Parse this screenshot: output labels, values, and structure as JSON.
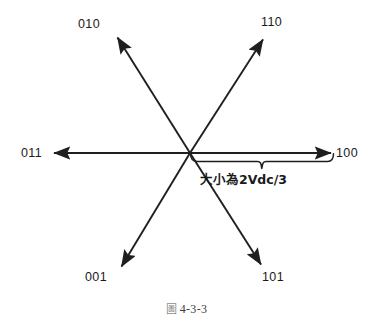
{
  "figure": {
    "caption_prefix": "圖",
    "caption_number": "4-3-3",
    "center": {
      "x": 190,
      "y": 153
    },
    "stroke_color": "#1f1f1f",
    "background_color": "#ffffff",
    "vectors": [
      {
        "id": "v010",
        "label": "010",
        "angle_deg": 120,
        "tip": {
          "x": 116,
          "y": 36
        },
        "label_pos": {
          "x": 90,
          "y": 20
        }
      },
      {
        "id": "v110",
        "label": "110",
        "angle_deg": 60,
        "tip": {
          "x": 264,
          "y": 38
        },
        "label_pos": {
          "x": 265,
          "y": 18
        }
      },
      {
        "id": "v100",
        "label": "100",
        "angle_deg": 0,
        "tip": {
          "x": 333,
          "y": 153
        },
        "label_pos": {
          "x": 337,
          "y": 147
        }
      },
      {
        "id": "v101",
        "label": "101",
        "angle_deg": -60,
        "tip": {
          "x": 262,
          "y": 266
        },
        "label_pos": {
          "x": 263,
          "y": 272
        }
      },
      {
        "id": "v001",
        "label": "001",
        "angle_deg": -120,
        "tip": {
          "x": 120,
          "y": 268
        },
        "label_pos": {
          "x": 88,
          "y": 272
        }
      },
      {
        "id": "v011",
        "label": "011",
        "angle_deg": 180,
        "tip": {
          "x": 52,
          "y": 153
        },
        "label_pos": {
          "x": 22,
          "y": 147
        }
      }
    ],
    "magnitude_annotation": {
      "text": "大小為2Vdc/3",
      "text_pos": {
        "x": 228,
        "y": 176
      },
      "brace_left_x": 192,
      "brace_right_x": 333,
      "brace_y": 161,
      "brace_tip": {
        "x": 262,
        "y": 169
      }
    }
  }
}
